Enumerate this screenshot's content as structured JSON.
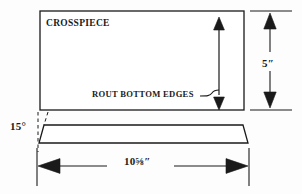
{
  "diagram": {
    "type": "woodworking-plan",
    "title_label": "CROSSPIECE",
    "note_label": "ROUT BOTTOM EDGES",
    "dimensions": {
      "height_label": "5″",
      "height_value": 5,
      "height_unit": "in",
      "length_label": "10⅝″",
      "length_whole": 10,
      "length_fraction_num": 5,
      "length_fraction_den": 8,
      "length_value": 10.625,
      "length_unit": "in",
      "bevel_label": "15°",
      "bevel_value": 15,
      "bevel_unit": "deg"
    },
    "colors": {
      "line": "#1a1a1a",
      "text": "#1a1a1a",
      "background": "#fdfdfd",
      "fill": "#ffffff"
    },
    "views": [
      {
        "name": "face-view",
        "shape": "rectangle"
      },
      {
        "name": "edge-view",
        "shape": "trapezoid"
      }
    ],
    "annotations": [
      {
        "name": "height-dimension",
        "orientation": "vertical",
        "arrows": "double"
      },
      {
        "name": "length-dimension",
        "orientation": "horizontal",
        "arrows": "double"
      },
      {
        "name": "rout-callout",
        "orientation": "vertical",
        "arrows": "double"
      },
      {
        "name": "bevel-angle-callout",
        "orientation": "angular",
        "arrows": "none"
      }
    ]
  }
}
